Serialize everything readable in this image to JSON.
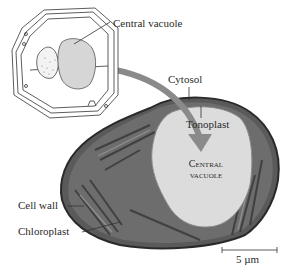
{
  "labels": {
    "central_vacuole_callout": "Central vacuole",
    "cytosol": "Cytosol",
    "tonoplast": "Tonoplast",
    "central_vacuole_inner_line1": "Central",
    "central_vacuole_inner_line2": "vacuole",
    "cell_wall": "Cell wall",
    "chloroplast": "Chloroplast",
    "scale_bar": "5 µm"
  },
  "colors": {
    "vacuole_fill": "#d6d6d6",
    "arrow": "#8a8a8a",
    "micrograph_dark": "#3a3a3a",
    "micrograph_mid": "#6e6e6e",
    "vacuole_micrograph": "#dcdcdc"
  }
}
